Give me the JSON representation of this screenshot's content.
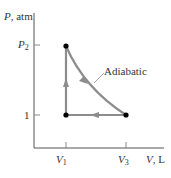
{
  "diagram": {
    "type": "pv-diagram",
    "y_axis_label_var": "P",
    "y_axis_label_unit": ", atm",
    "x_axis_label_var": "V",
    "x_axis_label_unit": ", L",
    "y_ticks": [
      {
        "var": "P",
        "sub": "2"
      },
      {
        "label": "1"
      }
    ],
    "x_ticks": [
      {
        "var": "V",
        "sub": "1"
      },
      {
        "var": "V",
        "sub": "3"
      }
    ],
    "curve_label": "Adiabatic",
    "colors": {
      "axis": "#555555",
      "path": "#8c8c8c",
      "point": "#000000",
      "text": "#333333"
    },
    "points": [
      {
        "name": "state-1",
        "v": "V1",
        "p": "1"
      },
      {
        "name": "state-2",
        "v": "V1",
        "p": "P2"
      },
      {
        "name": "state-3",
        "v": "V3",
        "p": "1"
      }
    ],
    "processes": [
      {
        "from": "state-1",
        "to": "state-2",
        "type": "isochoric"
      },
      {
        "from": "state-2",
        "to": "state-3",
        "type": "adiabatic"
      },
      {
        "from": "state-3",
        "to": "state-1",
        "type": "isobaric"
      }
    ]
  }
}
